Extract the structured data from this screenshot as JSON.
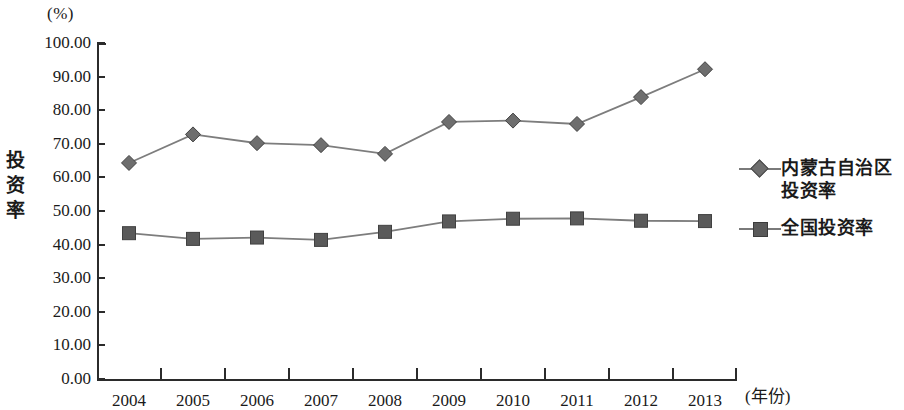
{
  "chart_data": {
    "type": "line",
    "title": "",
    "xlabel": "(年份)",
    "ylabel": "投资率",
    "yunit": "(%)",
    "ylim": [
      0,
      100
    ],
    "ytick_step": 10,
    "grid": false,
    "legend_position": "right",
    "categories": [
      "2004",
      "2005",
      "2006",
      "2007",
      "2008",
      "2009",
      "2010",
      "2011",
      "2012",
      "2013"
    ],
    "ytick_labels": [
      "100.00",
      "90.00",
      "80.00",
      "70.00",
      "60.00",
      "50.00",
      "40.00",
      "30.00",
      "20.00",
      "10.00",
      "0.00"
    ],
    "series": [
      {
        "name": "内蒙古自治区投资率",
        "marker": "diamond",
        "color": "#6e6e6e",
        "values": [
          64.3,
          72.8,
          70.2,
          69.6,
          67.0,
          76.5,
          76.9,
          75.9,
          83.9,
          92.2
        ]
      },
      {
        "name": "全国投资率",
        "marker": "square",
        "color": "#5a5a5a",
        "values": [
          43.4,
          41.7,
          42.1,
          41.4,
          43.8,
          46.9,
          47.7,
          47.8,
          47.1,
          47.0
        ]
      }
    ]
  },
  "legend": {
    "items": [
      {
        "label_line1": "内蒙古自治区",
        "label_line2": "投资率",
        "marker": "diamond-marker"
      },
      {
        "label_line1": "全国投资率",
        "label_line2": "",
        "marker": "square-marker"
      }
    ]
  }
}
